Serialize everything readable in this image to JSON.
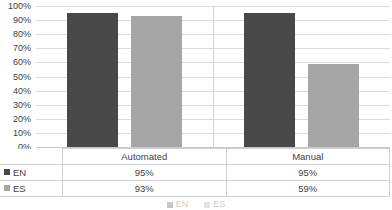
{
  "chart_data": {
    "type": "bar",
    "title": "",
    "xlabel": "",
    "ylabel": "",
    "ylim": [
      0,
      100
    ],
    "grid": true,
    "legend_position": "bottom",
    "categories": [
      "Automated",
      "Manual"
    ],
    "series": [
      {
        "name": "EN",
        "values": [
          95,
          95
        ],
        "labels": [
          "95%",
          "95%"
        ],
        "color": "#484848"
      },
      {
        "name": "ES",
        "values": [
          93,
          59
        ],
        "labels": [
          "93%",
          "59%"
        ],
        "color": "#a6a6a6"
      }
    ],
    "y_ticks": [
      {
        "value": 100,
        "label": "100%"
      },
      {
        "value": 90,
        "label": "90%"
      },
      {
        "value": 80,
        "label": "80%"
      },
      {
        "value": 70,
        "label": "70%"
      },
      {
        "value": 60,
        "label": "60%"
      },
      {
        "value": 50,
        "label": "50%"
      },
      {
        "value": 40,
        "label": "40%"
      },
      {
        "value": 30,
        "label": "30%"
      },
      {
        "value": 20,
        "label": "20%"
      },
      {
        "value": 10,
        "label": "10%"
      },
      {
        "value": 0,
        "label": "0%"
      }
    ]
  },
  "data_table": {
    "corner_label": "",
    "column_headers": [
      "Automated",
      "Manual"
    ],
    "rows": [
      {
        "legend": "EN",
        "color": "#484848",
        "cells": [
          "95%",
          "95%"
        ]
      },
      {
        "legend": "ES",
        "color": "#a6a6a6",
        "cells": [
          "93%",
          "59%"
        ]
      }
    ]
  },
  "bottom_legend": {
    "items": [
      {
        "label": "EN",
        "color": "#484848"
      },
      {
        "label": "ES",
        "color": "#a6a6a6"
      }
    ]
  },
  "colors": {
    "series_en": "#484848",
    "series_es": "#a6a6a6",
    "gridline": "#dcdcdc",
    "axis": "#c8c8c8",
    "table_border": "#d0d0d0",
    "text": "#3f3f3f",
    "background": "#ffffff"
  }
}
